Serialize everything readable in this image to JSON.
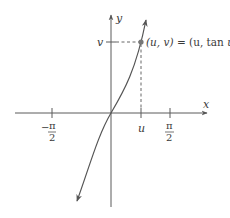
{
  "diagram": {
    "axes": {
      "x_label": "x",
      "y_label": "y"
    },
    "ticks": {
      "neg_half_pi": {
        "sign": "−",
        "num": "π",
        "den": "2"
      },
      "u": "u",
      "pos_half_pi": {
        "num": "π",
        "den": "2"
      },
      "v": "v"
    },
    "point_label": {
      "lhs": "(u, v)",
      "eq": " = ",
      "rhs_open": "(u, ",
      "rhs_fn": "tan",
      "rhs_var": " u",
      "rhs_close": ")"
    },
    "colors": {
      "axis": "#5a5a5a",
      "curve": "#555555",
      "dashed": "#666666",
      "point": "#777777",
      "text": "#3a3a3a"
    }
  }
}
